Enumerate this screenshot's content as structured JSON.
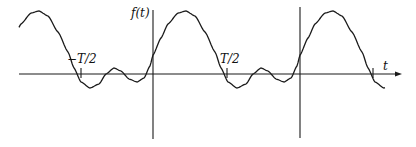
{
  "figure": {
    "y_axis_label": "f(t)",
    "x_axis_label": "t",
    "tick_labels": [
      "−T/2",
      "T/2"
    ]
  },
  "colors": {
    "line": "#1a1a1a",
    "background": "#ffffff"
  }
}
